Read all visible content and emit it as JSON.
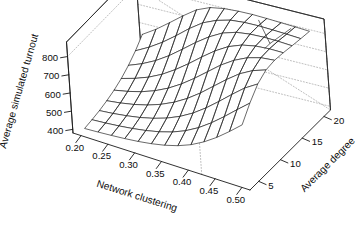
{
  "figure": {
    "kind": "3d-wireframe-surface",
    "background_color": "#ffffff",
    "line_color": "#242424",
    "grid_color": "#b4b4b4"
  },
  "chart_data": {
    "type": "surface",
    "title": "",
    "xlabel": "Network clustering",
    "ylabel": "Average degree",
    "zlabel": "Average simulated turnout",
    "xticks": [
      "0.20",
      "0.25",
      "0.30",
      "0.35",
      "0.40",
      "0.45",
      "0.50"
    ],
    "xtick_values": [
      0.2,
      0.25,
      0.3,
      0.35,
      0.4,
      0.45,
      0.5
    ],
    "yticks": [
      "5",
      "10",
      "15",
      "20"
    ],
    "ytick_values": [
      5,
      10,
      15,
      20
    ],
    "zticks": [
      "400",
      "500",
      "600",
      "700",
      "800"
    ],
    "ztick_values": [
      400,
      500,
      600,
      700,
      800
    ],
    "xlim": [
      0.185,
      0.515
    ],
    "ylim": [
      3.0,
      21.5
    ],
    "zlim": [
      380,
      880
    ],
    "grid": "dotted-backplane",
    "legend": "none",
    "x": [
      0.2,
      0.225,
      0.25,
      0.275,
      0.3,
      0.325,
      0.35,
      0.375,
      0.4,
      0.425,
      0.45,
      0.475,
      0.5
    ],
    "y": [
      4,
      6,
      8,
      10,
      12,
      14,
      16,
      18,
      20
    ],
    "z": [
      [
        398,
        404,
        412,
        424,
        440,
        462,
        492,
        530,
        578
      ],
      [
        402,
        409,
        419,
        434,
        455,
        484,
        522,
        570,
        626
      ],
      [
        407,
        416,
        429,
        448,
        475,
        512,
        560,
        618,
        682
      ],
      [
        413,
        425,
        442,
        467,
        502,
        549,
        608,
        674,
        740
      ],
      [
        421,
        437,
        460,
        493,
        538,
        596,
        664,
        734,
        793
      ],
      [
        432,
        453,
        484,
        527,
        583,
        650,
        722,
        786,
        826
      ],
      [
        447,
        475,
        516,
        570,
        636,
        708,
        774,
        820,
        840
      ],
      [
        468,
        505,
        557,
        622,
        694,
        763,
        816,
        842,
        846
      ],
      [
        497,
        545,
        608,
        681,
        752,
        808,
        841,
        850,
        848
      ],
      [
        536,
        595,
        666,
        740,
        800,
        838,
        852,
        852,
        846
      ],
      [
        584,
        652,
        727,
        794,
        836,
        854,
        856,
        850,
        843
      ],
      [
        640,
        713,
        785,
        834,
        858,
        860,
        855,
        847,
        840
      ],
      [
        700,
        772,
        830,
        860,
        866,
        860,
        851,
        843,
        836
      ]
    ],
    "notch": {
      "present": true,
      "description": "local downward fold near far-right corner of the surface"
    }
  },
  "projection": {
    "theta_deg": -36,
    "phi_deg": 22,
    "scale": 1.0
  }
}
